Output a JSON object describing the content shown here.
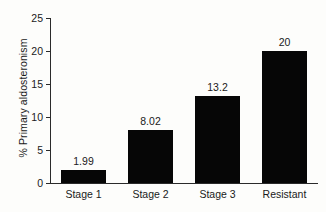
{
  "chart_data": {
    "type": "bar",
    "title": "",
    "xlabel": "",
    "ylabel": "% Primary aldosteronism",
    "categories": [
      "Stage 1",
      "Stage 2",
      "Stage 3",
      "Resistant"
    ],
    "values": [
      1.99,
      8.02,
      13.2,
      20
    ],
    "value_labels": [
      "1.99",
      "8.02",
      "13.2",
      "20"
    ],
    "ylim": [
      0,
      25
    ],
    "yticks": [
      0,
      5,
      10,
      15,
      20,
      25
    ],
    "ytick_labels": [
      "0",
      "5",
      "10",
      "15",
      "20",
      "25"
    ],
    "grid": false,
    "legend": false,
    "legend_position": "none",
    "bar_color": "#060606",
    "axis_color": "#2a2a2a",
    "background_color": "#fdfdfb"
  }
}
